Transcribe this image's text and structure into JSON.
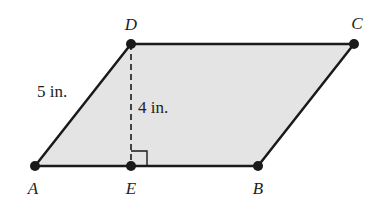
{
  "diagram": {
    "type": "parallelogram",
    "fill_color": "#e4e4e4",
    "stroke_color": "#1a1a1a",
    "vertices": {
      "A": {
        "label": "A",
        "x": 35,
        "y": 166
      },
      "B": {
        "label": "B",
        "x": 258,
        "y": 166
      },
      "C": {
        "label": "C",
        "x": 354,
        "y": 44
      },
      "D": {
        "label": "D",
        "x": 131,
        "y": 44
      },
      "E": {
        "label": "E",
        "x": 131,
        "y": 166
      }
    },
    "measurements": {
      "side_AD": "5 in.",
      "height_DE": "4 in."
    },
    "annotations": {
      "height_line": "dashed segment DE perpendicular to AB",
      "right_angle_marker": "at E"
    }
  }
}
